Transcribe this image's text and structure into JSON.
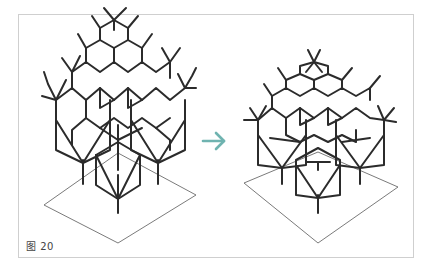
{
  "caption": "图 20",
  "colors": {
    "frame_border": "#cfcfcf",
    "structure_stroke": "#2b2b2b",
    "base_plane_stroke": "#6b6b6b",
    "arrow": "#6fb3b0"
  },
  "panels": [
    {
      "name": "left-structure",
      "description": "tall branching tree-like lattice structure standing on a diamond base plane"
    },
    {
      "name": "right-structure",
      "description": "shorter, denser branching lattice structure on a diamond base plane"
    }
  ],
  "arrow": {
    "icon": "right-arrow-icon",
    "glyph": "→"
  }
}
